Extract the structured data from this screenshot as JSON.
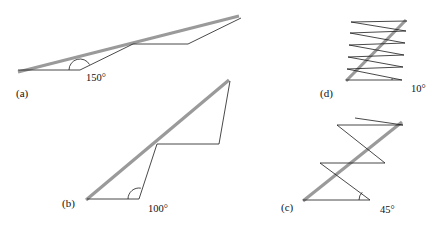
{
  "figure": {
    "background_color": "#ffffff",
    "path_color": "#1a1a1a",
    "chord_color": "#9a9a9a",
    "width": 440,
    "height": 226,
    "panels": [
      {
        "id": "a",
        "label": "(a)",
        "label_pos": {
          "x": 16,
          "y": 88
        },
        "angle_label": "150°",
        "angle_label_pos": {
          "x": 86,
          "y": 73
        },
        "angle_arc": {
          "cx": 80,
          "cy": 70,
          "r": 11,
          "start_deg": 180,
          "end_deg": 30
        },
        "zigzag_points": "18,70 80,70 133,44 188,44 241,18",
        "chord_points": "18,72 239,16",
        "label_caption": "150 degree turn zigzag"
      },
      {
        "id": "b",
        "label": "(b)",
        "label_pos": {
          "x": 62,
          "y": 198
        },
        "angle_label": "100°",
        "angle_label_pos": {
          "x": 148,
          "y": 204
        },
        "angle_arc": {
          "cx": 139,
          "cy": 199,
          "r": 11,
          "start_deg": 180,
          "end_deg": 80
        },
        "zigzag_points": "87,199 139,199 157,144 219,144 230,81",
        "chord_points": "86,200 229,80",
        "label_caption": "100 degree turn zigzag"
      },
      {
        "id": "c",
        "label": "(c)",
        "label_pos": {
          "x": 281,
          "y": 202
        },
        "angle_label": "45°",
        "angle_label_pos": {
          "x": 380,
          "y": 205
        },
        "angle_arc": {
          "cx": 370,
          "cy": 200,
          "r": 11,
          "start_deg": 180,
          "end_deg": 135
        },
        "zigzag_points": "303,200 370,200 320,163 385,163 337,125 403,125 355,118",
        "chord_points": "303,201 402,122",
        "label_caption": "45 degree turn zigzag"
      },
      {
        "id": "d",
        "label": "(d)",
        "label_pos": {
          "x": 320,
          "y": 88
        },
        "angle_label": "10°",
        "angle_label_pos": {
          "x": 411,
          "y": 84
        },
        "angle_arc": {
          "cx": 402,
          "cy": 80,
          "r": 10,
          "start_deg": 180,
          "end_deg": 170
        },
        "zigzag_points": "346,80 402,80 347,69 403,67 348,57 404,55 349,45 405,43 350,33 406,31 351,22 407,21",
        "chord_points": "346,81 406,20",
        "label_caption": "10 degree turn zigzag"
      }
    ]
  }
}
